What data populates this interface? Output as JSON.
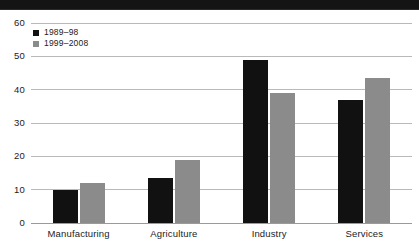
{
  "banner": {
    "present": true,
    "color": "#141414",
    "label": ""
  },
  "chart_data": {
    "type": "bar",
    "title": "",
    "subtitle": "",
    "xlabel": "",
    "ylabel": "",
    "categories": [
      "Manufacturing",
      "Agriculture",
      "Industry",
      "Services"
    ],
    "series": [
      {
        "name": "1989–98",
        "color": "#111111",
        "values": [
          10,
          13.5,
          49,
          37
        ]
      },
      {
        "name": "1999–2008",
        "color": "#8b8b8b",
        "values": [
          12,
          19,
          39,
          43.5
        ]
      }
    ],
    "ylim": [
      0,
      60
    ],
    "yticks": [
      0,
      10,
      20,
      30,
      40,
      50,
      60
    ],
    "ytick_labels": [
      "0",
      "10",
      "20",
      "30",
      "40",
      "50",
      "60"
    ],
    "grid": true,
    "grid_axis": "y",
    "grid_color": "#b9b9b9",
    "legend_position": "top-left",
    "annotations": []
  },
  "colors": {
    "background": "#ffffff",
    "text": "#1b1b1b",
    "grid": "#b9b9b9",
    "baseline": "#9a9a9a",
    "series_1": "#111111",
    "series_2": "#8b8b8b",
    "banner": "#141414"
  }
}
